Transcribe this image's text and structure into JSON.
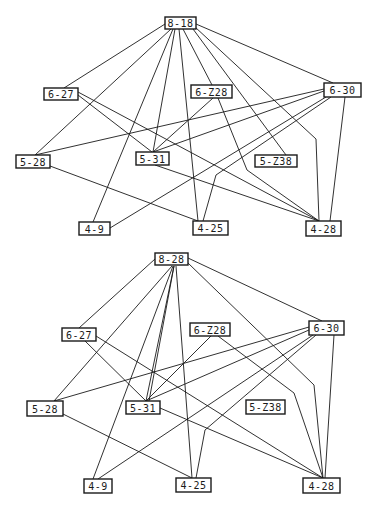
{
  "graphs": [
    {
      "id": "top",
      "nodes": [
        {
          "id": "8-18",
          "label": "8-18",
          "x": 165,
          "y": 17,
          "w": 31,
          "h": 12
        },
        {
          "id": "6-27",
          "label": "6-27",
          "x": 44,
          "y": 88,
          "w": 34,
          "h": 12
        },
        {
          "id": "6-Z28",
          "label": "6-Z28",
          "x": 191,
          "y": 85,
          "w": 41,
          "h": 13
        },
        {
          "id": "6-30",
          "label": "6-30",
          "x": 324,
          "y": 83,
          "w": 37,
          "h": 14
        },
        {
          "id": "5-28",
          "label": "5-28",
          "x": 16,
          "y": 155,
          "w": 34,
          "h": 13
        },
        {
          "id": "5-31",
          "label": "5-31",
          "x": 136,
          "y": 152,
          "w": 33,
          "h": 13
        },
        {
          "id": "5-Z38",
          "label": "5-Z38",
          "x": 255,
          "y": 155,
          "w": 42,
          "h": 12
        },
        {
          "id": "4-9",
          "label": "4-9",
          "x": 79,
          "y": 222,
          "w": 31,
          "h": 13
        },
        {
          "id": "4-25",
          "label": "4-25",
          "x": 193,
          "y": 221,
          "w": 35,
          "h": 14
        },
        {
          "id": "4-28",
          "label": "4-28",
          "x": 306,
          "y": 221,
          "w": 35,
          "h": 15
        }
      ],
      "edges": [
        {
          "from": "8-18",
          "to": "6-27",
          "points": [
            [
              165,
              24
            ],
            [
              64,
              88
            ]
          ]
        },
        {
          "from": "8-18",
          "to": "5-28",
          "points": [
            [
              171,
              29
            ],
            [
              35,
              155
            ]
          ]
        },
        {
          "from": "8-18",
          "to": "4-9",
          "points": [
            [
              173,
              29
            ],
            [
              93,
              222
            ]
          ]
        },
        {
          "from": "8-18",
          "to": "5-31",
          "points": [
            [
              175,
              29
            ],
            [
              153,
              152
            ]
          ]
        },
        {
          "from": "8-18",
          "to": "4-25",
          "points": [
            [
              179,
              29
            ],
            [
              198,
              221
            ]
          ]
        },
        {
          "from": "8-18",
          "to": "6-Z28",
          "points": [
            [
              183,
              29
            ],
            [
              212,
              85
            ]
          ]
        },
        {
          "from": "8-18",
          "to": "5-Z38",
          "points": [
            [
              193,
              29
            ],
            [
              286,
              155
            ]
          ]
        },
        {
          "from": "8-18",
          "to": "4-28",
          "points": [
            [
              195,
              27
            ],
            [
              316,
              139
            ],
            [
              319,
              221
            ]
          ]
        },
        {
          "from": "8-18",
          "to": "6-30",
          "points": [
            [
              196,
              24
            ],
            [
              333,
              83
            ]
          ]
        },
        {
          "from": "6-27",
          "to": "5-31",
          "points": [
            [
              78,
              95
            ],
            [
              152,
              152
            ]
          ]
        },
        {
          "from": "6-27",
          "to": "4-28",
          "points": [
            [
              78,
              92
            ],
            [
              319,
              221
            ]
          ]
        },
        {
          "from": "6-Z28",
          "to": "5-31",
          "points": [
            [
              213,
              98
            ],
            [
              153,
              152
            ]
          ]
        },
        {
          "from": "6-Z28",
          "to": "4-28",
          "points": [
            [
              218,
              98
            ],
            [
              247,
              170
            ],
            [
              319,
              221
            ]
          ]
        },
        {
          "from": "6-30",
          "to": "5-28",
          "points": [
            [
              324,
              89
            ],
            [
              35,
              155
            ]
          ]
        },
        {
          "from": "6-30",
          "to": "5-31",
          "points": [
            [
              324,
              91
            ],
            [
              153,
              152
            ]
          ]
        },
        {
          "from": "6-30",
          "to": "4-9",
          "points": [
            [
              326,
              97
            ],
            [
              110,
              228
            ]
          ]
        },
        {
          "from": "6-30",
          "to": "4-25",
          "points": [
            [
              331,
              97
            ],
            [
              216,
              175
            ],
            [
              203,
              221
            ]
          ]
        },
        {
          "from": "6-30",
          "to": "4-28",
          "points": [
            [
              345,
              97
            ],
            [
              330,
              221
            ]
          ]
        },
        {
          "from": "5-28",
          "to": "4-25",
          "points": [
            [
              50,
              166
            ],
            [
              198,
              221
            ]
          ]
        },
        {
          "from": "5-31",
          "to": "4-28",
          "points": [
            [
              155,
              165
            ],
            [
              319,
              221
            ]
          ]
        }
      ]
    },
    {
      "id": "bottom",
      "nodes": [
        {
          "id": "8-28",
          "label": "8-28",
          "x": 155,
          "y": 253,
          "w": 33,
          "h": 12
        },
        {
          "id": "6-27",
          "label": "6-27",
          "x": 62,
          "y": 328,
          "w": 34,
          "h": 13
        },
        {
          "id": "6-Z28",
          "label": "6-Z28",
          "x": 190,
          "y": 323,
          "w": 40,
          "h": 13
        },
        {
          "id": "6-30",
          "label": "6-30",
          "x": 309,
          "y": 321,
          "w": 35,
          "h": 14
        },
        {
          "id": "5-28",
          "label": "5-28",
          "x": 27,
          "y": 401,
          "w": 36,
          "h": 15
        },
        {
          "id": "5-31",
          "label": "5-31",
          "x": 126,
          "y": 401,
          "w": 34,
          "h": 13
        },
        {
          "id": "5-Z38",
          "label": "5-Z38",
          "x": 246,
          "y": 400,
          "w": 39,
          "h": 14
        },
        {
          "id": "4-9",
          "label": "4-9",
          "x": 84,
          "y": 479,
          "w": 28,
          "h": 14
        },
        {
          "id": "4-25",
          "label": "4-25",
          "x": 176,
          "y": 478,
          "w": 35,
          "h": 14
        },
        {
          "id": "4-28",
          "label": "4-28",
          "x": 303,
          "y": 478,
          "w": 37,
          "h": 15
        }
      ],
      "edges": [
        {
          "from": "8-28",
          "to": "6-27",
          "points": [
            [
              155,
              259
            ],
            [
              79,
              328
            ]
          ]
        },
        {
          "from": "8-28",
          "to": "5-28",
          "points": [
            [
              172,
              266
            ],
            [
              54,
              401
            ]
          ]
        },
        {
          "from": "8-28",
          "to": "4-9",
          "points": [
            [
              173,
              266
            ],
            [
              93,
              479
            ]
          ]
        },
        {
          "from": "8-28",
          "to": "5-31",
          "points": [
            [
              174,
              266
            ],
            [
              149,
              401
            ]
          ]
        },
        {
          "from": "8-28",
          "to": "5-31b",
          "points": [
            [
              174,
              266
            ],
            [
              146,
              401
            ]
          ]
        },
        {
          "from": "8-28",
          "to": "4-25",
          "points": [
            [
              176,
              266
            ],
            [
              192,
              478
            ]
          ]
        },
        {
          "from": "8-28",
          "to": "4-28",
          "points": [
            [
              188,
              263
            ],
            [
              314,
              385
            ],
            [
              323,
              478
            ]
          ]
        },
        {
          "from": "8-28",
          "to": "6-30",
          "points": [
            [
              188,
              258
            ],
            [
              322,
              321
            ]
          ]
        },
        {
          "from": "6-27",
          "to": "5-31",
          "points": [
            [
              85,
              341
            ],
            [
              146,
              401
            ]
          ]
        },
        {
          "from": "6-27",
          "to": "4-28",
          "points": [
            [
              96,
              336
            ],
            [
              323,
              478
            ]
          ]
        },
        {
          "from": "6-Z28",
          "to": "5-31",
          "points": [
            [
              211,
              336
            ],
            [
              146,
              401
            ]
          ]
        },
        {
          "from": "6-Z28",
          "to": "4-28",
          "points": [
            [
              218,
              336
            ],
            [
              294,
              393
            ],
            [
              323,
              478
            ]
          ]
        },
        {
          "from": "6-30",
          "to": "5-28",
          "points": [
            [
              309,
              327
            ],
            [
              54,
              401
            ]
          ]
        },
        {
          "from": "6-30",
          "to": "5-31",
          "points": [
            [
              309,
              330
            ],
            [
              146,
              401
            ]
          ]
        },
        {
          "from": "6-30",
          "to": "4-9",
          "points": [
            [
              313,
              335
            ],
            [
              98,
              479
            ]
          ]
        },
        {
          "from": "6-30",
          "to": "4-25",
          "points": [
            [
              316,
              335
            ],
            [
              205,
              430
            ],
            [
              196,
              478
            ]
          ]
        },
        {
          "from": "6-30",
          "to": "4-28",
          "points": [
            [
              334,
              335
            ],
            [
              325,
              478
            ]
          ]
        },
        {
          "from": "5-28",
          "to": "4-25",
          "points": [
            [
              63,
              414
            ],
            [
              192,
              478
            ]
          ]
        },
        {
          "from": "5-31",
          "to": "4-28",
          "points": [
            [
              160,
              408
            ],
            [
              323,
              478
            ]
          ]
        }
      ]
    }
  ],
  "colors": {
    "ink": "#1a1a1a",
    "paper": "#ffffff"
  }
}
